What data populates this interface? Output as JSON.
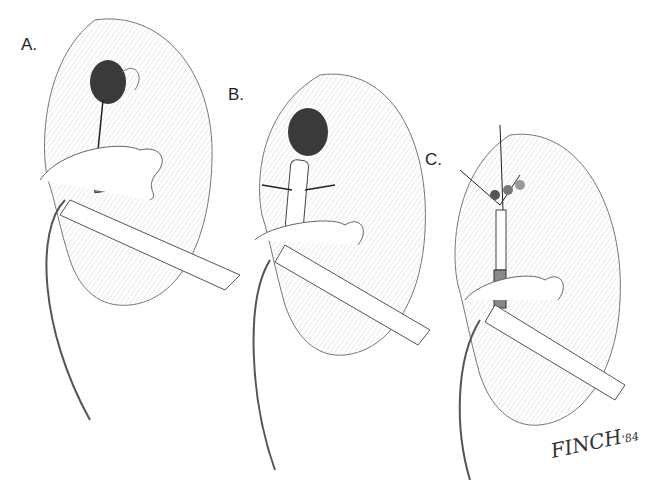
{
  "figure": {
    "panels": [
      {
        "label": "A.",
        "caption": "Calyceal stone with wire passed through infundibulum; sheath at UPJ"
      },
      {
        "label": "B.",
        "caption": "Balloon dilation of infundibulum (arrows indicate dilation)"
      },
      {
        "label": "C.",
        "caption": "Stone fragments in calyx with multiple wires; sheath in pelvis"
      }
    ],
    "signature": {
      "name": "FINCH",
      "year": "'84"
    },
    "colors": {
      "line": "#555555",
      "shade": "#3a3a3a",
      "background": "#ffffff"
    }
  }
}
